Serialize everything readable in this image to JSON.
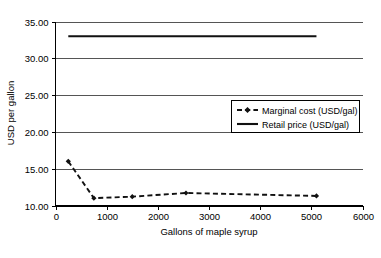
{
  "chart_data": {
    "type": "line",
    "title": "",
    "xlabel": "Gallons of maple syrup",
    "ylabel": "USD per gallon",
    "xlim": [
      0,
      6000
    ],
    "ylim": [
      10.0,
      35.0
    ],
    "xticks": [
      "0",
      "1000",
      "2000",
      "3000",
      "4000",
      "5000",
      "6000"
    ],
    "xtick_values": [
      0,
      1000,
      2000,
      3000,
      4000,
      5000,
      6000
    ],
    "yticks": [
      "10.00",
      "15.00",
      "20.00",
      "25.00",
      "30.00",
      "35.00"
    ],
    "ytick_values": [
      10.0,
      15.0,
      20.0,
      25.0,
      30.0,
      35.0
    ],
    "grid": "horizontal",
    "legend_position": "upper-right-inside",
    "series": [
      {
        "name": "Marginal cost (USD/gal)",
        "style": "dashed-with-markers",
        "marker": "diamond",
        "color": "#111111",
        "x": [
          250,
          750,
          1500,
          2550,
          5100
        ],
        "values": [
          16.0,
          11.0,
          11.2,
          11.7,
          11.3
        ]
      },
      {
        "name": "Retail price (USD/gal)",
        "style": "solid",
        "marker": "none",
        "color": "#111111",
        "x": [
          250,
          5100
        ],
        "values": [
          33.0,
          33.0
        ]
      }
    ]
  },
  "legend": {
    "entries": [
      {
        "label": "Marginal cost (USD/gal)"
      },
      {
        "label": "Retail price (USD/gal)"
      }
    ]
  }
}
